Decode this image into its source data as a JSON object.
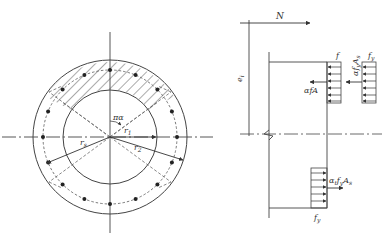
{
  "figure": {
    "left_panel": {
      "title": "Annular cross-section with uniformly distributed reinforcement",
      "labels": {
        "angle": "πα",
        "r1": "r",
        "r1_sub": "1",
        "r2": "r",
        "r2_sub": "2",
        "rs": "r",
        "rs_sub": "s"
      },
      "rebar_count": 16
    },
    "right_panel": {
      "title": "Stress distribution diagram",
      "labels": {
        "N": "N",
        "ei": "e",
        "ei_sub": "i",
        "f": "f",
        "fy_top": "f",
        "fy_top_sub": "y",
        "alpha_f_A": "αfA",
        "alpha_fy_As": "αf",
        "alpha_fy_As_sub1": "y",
        "alpha_fy_As_tail": "A",
        "alpha_fy_As_sub2": "s",
        "alpha_t_fy_As": "α",
        "alpha_t_fy_As_sub1": "t",
        "alpha_t_fy_As_mid": "f",
        "alpha_t_fy_As_sub2": "y",
        "alpha_t_fy_As_tail": "A",
        "alpha_t_fy_As_sub3": "s",
        "fy_bottom": "f",
        "fy_bottom_sub": "y"
      }
    },
    "colors": {
      "line": "#444444",
      "text": "#333333",
      "background": "#ffffff"
    }
  }
}
